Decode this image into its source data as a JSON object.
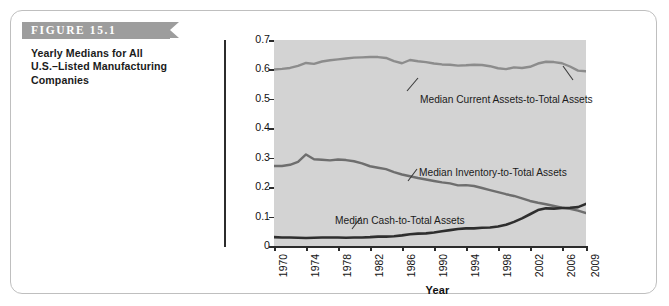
{
  "figure": {
    "banner_label": "FIGURE 15.1",
    "caption_lines": [
      "Yearly Medians for All",
      "U.S.–Listed Manufacturing",
      "Companies"
    ]
  },
  "chart_data": {
    "type": "line",
    "xlabel": "Year",
    "ylabel": "",
    "xlim": [
      1970,
      2009
    ],
    "ylim": [
      0,
      0.7
    ],
    "grid": false,
    "legend_position": "inline-annotation",
    "plot_background": "#d3d3d3",
    "y_ticks": [
      "0",
      "0.1",
      "0.2",
      "0.3",
      "0.4",
      "0.5",
      "0.6",
      "0.7"
    ],
    "y_tick_values": [
      0,
      0.1,
      0.2,
      0.3,
      0.4,
      0.5,
      0.6,
      0.7
    ],
    "x_ticks": [
      "1970",
      "1974",
      "1978",
      "1982",
      "1986",
      "1990",
      "1994",
      "1998",
      "2002",
      "2006",
      "2009"
    ],
    "x_tick_values": [
      1970,
      1974,
      1978,
      1982,
      1986,
      1990,
      1994,
      1998,
      2002,
      2006,
      2009
    ],
    "x": [
      1970,
      1971,
      1972,
      1973,
      1974,
      1975,
      1976,
      1977,
      1978,
      1979,
      1980,
      1981,
      1982,
      1983,
      1984,
      1985,
      1986,
      1987,
      1988,
      1989,
      1990,
      1991,
      1992,
      1993,
      1994,
      1995,
      1996,
      1997,
      1998,
      1999,
      2000,
      2001,
      2002,
      2003,
      2004,
      2005,
      2006,
      2007,
      2008,
      2009
    ],
    "series": [
      {
        "name": "Median Current Assets-to-Total Assets",
        "color": "#8c8c8c",
        "annotation": "Median Current Assets-to-Total Assets",
        "values": [
          0.6,
          0.602,
          0.605,
          0.612,
          0.622,
          0.619,
          0.627,
          0.631,
          0.634,
          0.637,
          0.64,
          0.641,
          0.642,
          0.642,
          0.639,
          0.628,
          0.621,
          0.632,
          0.628,
          0.625,
          0.62,
          0.617,
          0.616,
          0.613,
          0.614,
          0.616,
          0.615,
          0.611,
          0.604,
          0.601,
          0.607,
          0.605,
          0.609,
          0.62,
          0.626,
          0.625,
          0.621,
          0.61,
          0.596,
          0.594
        ]
      },
      {
        "name": "Median Inventory-to-Total Assets",
        "color": "#6e6e6e",
        "annotation": "Median Inventory-to-Total Assets",
        "values": [
          0.272,
          0.272,
          0.276,
          0.286,
          0.311,
          0.295,
          0.293,
          0.291,
          0.294,
          0.292,
          0.288,
          0.281,
          0.271,
          0.266,
          0.261,
          0.251,
          0.243,
          0.237,
          0.231,
          0.226,
          0.221,
          0.216,
          0.213,
          0.206,
          0.207,
          0.204,
          0.197,
          0.19,
          0.183,
          0.176,
          0.17,
          0.162,
          0.153,
          0.147,
          0.142,
          0.136,
          0.13,
          0.126,
          0.12,
          0.112
        ]
      },
      {
        "name": "Median Cash-to-Total Assets",
        "color": "#2e2e2e",
        "annotation": "Median Cash-to-Total Assets",
        "values": [
          0.03,
          0.029,
          0.029,
          0.028,
          0.027,
          0.028,
          0.029,
          0.029,
          0.029,
          0.028,
          0.029,
          0.029,
          0.03,
          0.032,
          0.032,
          0.033,
          0.036,
          0.04,
          0.042,
          0.043,
          0.046,
          0.05,
          0.054,
          0.058,
          0.06,
          0.06,
          0.062,
          0.063,
          0.066,
          0.072,
          0.082,
          0.094,
          0.108,
          0.122,
          0.128,
          0.127,
          0.129,
          0.13,
          0.132,
          0.143
        ]
      }
    ]
  }
}
